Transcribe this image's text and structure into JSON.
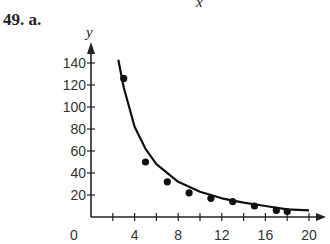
{
  "header": {
    "cutoff_label": "x",
    "problem_label": "49. a."
  },
  "chart_data": {
    "type": "scatter",
    "title": "",
    "xlabel": "x",
    "ylabel": "y",
    "xlim": [
      0,
      21
    ],
    "ylim": [
      0,
      150
    ],
    "x_ticks": [
      2,
      4,
      6,
      8,
      10,
      12,
      14,
      16,
      18,
      20
    ],
    "x_tick_labels": [
      "0",
      "4",
      "8",
      "12",
      "16",
      "20"
    ],
    "y_ticks": [
      20,
      40,
      60,
      80,
      100,
      120,
      140
    ],
    "y_tick_labels": [
      "20",
      "40",
      "60",
      "80",
      "100",
      "120",
      "140"
    ],
    "grid": false,
    "legend": null,
    "series": [
      {
        "name": "data points",
        "type": "scatter",
        "x": [
          3,
          5,
          7,
          9,
          11,
          13,
          15,
          17,
          18
        ],
        "y": [
          126,
          50,
          32,
          22,
          17,
          14,
          10,
          6,
          5
        ]
      },
      {
        "name": "fitted curve",
        "type": "line",
        "x": [
          2.5,
          3,
          4,
          5,
          6,
          8,
          10,
          12,
          14,
          16,
          18,
          20
        ],
        "y": [
          143,
          118,
          82,
          62,
          48,
          32,
          23,
          17,
          13,
          10,
          7,
          6
        ]
      }
    ]
  }
}
